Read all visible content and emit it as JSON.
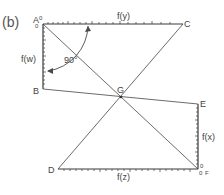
{
  "panel_label": "(b)",
  "points": {
    "A": {
      "label": "A",
      "x": 43,
      "y": 24
    },
    "B": {
      "label": "B",
      "x": 43,
      "y": 89
    },
    "C": {
      "label": "C",
      "x": 183,
      "y": 24
    },
    "D": {
      "label": "D",
      "x": 58,
      "y": 169
    },
    "E": {
      "label": "E",
      "x": 198,
      "y": 104
    },
    "F": {
      "label": "F",
      "x": 198,
      "y": 169
    },
    "G": {
      "label": "G",
      "x": 121,
      "y": 97
    }
  },
  "scales": {
    "y": {
      "label": "f(y)",
      "from": "A",
      "to": "C"
    },
    "w": {
      "label": "f(w)",
      "from": "A",
      "to": "B"
    },
    "x": {
      "label": "f(x)",
      "from": "E",
      "to": "F"
    },
    "z": {
      "label": "f(z)",
      "from": "D",
      "to": "F"
    }
  },
  "angle": {
    "label": "90°",
    "value": 90
  },
  "zero_marks": {
    "A_top": "0",
    "A_left": "0",
    "F_top": "0",
    "F_left": "0"
  },
  "colors": {
    "line": "#5a5a5a",
    "text": "#444444",
    "background": "#ffffff"
  }
}
